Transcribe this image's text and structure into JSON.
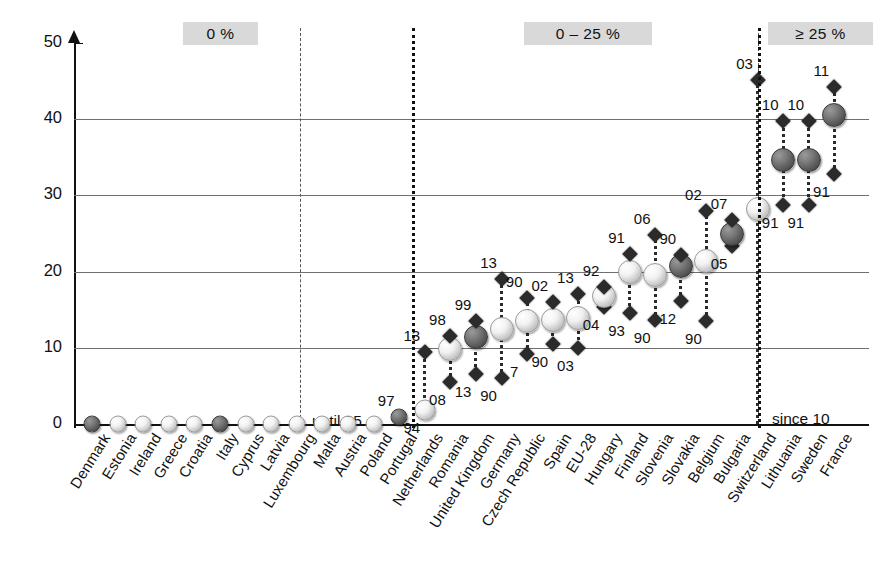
{
  "chart_data": {
    "type": "scatter",
    "title": "",
    "xlabel": "",
    "ylabel": "",
    "ylim": [
      0,
      50
    ],
    "ytick_labels": [
      "0",
      "10",
      "20",
      "30",
      "40",
      "50"
    ],
    "ytick_values": [
      0,
      10,
      20,
      30,
      40,
      50
    ],
    "grid": "horizontal gridlines at 10, 20, 30, 40",
    "legend_position": "none",
    "band_labels": [
      "0 %",
      "0 – 25 %",
      "≥ 25 %"
    ],
    "annotations": [
      "until 95",
      "since 10"
    ],
    "categories": [
      "Denmark",
      "Estonia",
      "Ireland",
      "Greece",
      "Croatia",
      "Italy",
      "Cyprus",
      "Latvia",
      "Luxembourg",
      "Malta",
      "Austria",
      "Poland",
      "Portugal",
      "Netherlands",
      "Romania",
      "United Kingdom",
      "Germany",
      "Czech Republic",
      "Spain",
      "EU-28",
      "Hungary",
      "Finland",
      "Slovenia",
      "Slovakia",
      "Belgium",
      "Bulgaria",
      "Switzerland",
      "Lithuania",
      "Sweden",
      "France"
    ],
    "points": [
      {
        "country": "Denmark",
        "top": 0,
        "bottom": 0,
        "top_year": "",
        "bottom_year": "",
        "top_marker": "sphere-dark",
        "bottom_marker": "none"
      },
      {
        "country": "Estonia",
        "top": 0,
        "bottom": 0,
        "top_year": "",
        "bottom_year": "",
        "top_marker": "sphere-light",
        "bottom_marker": "none"
      },
      {
        "country": "Ireland",
        "top": 0,
        "bottom": 0,
        "top_year": "",
        "bottom_year": "",
        "top_marker": "sphere-light",
        "bottom_marker": "none"
      },
      {
        "country": "Greece",
        "top": 0,
        "bottom": 0,
        "top_year": "",
        "bottom_year": "",
        "top_marker": "sphere-light",
        "bottom_marker": "none"
      },
      {
        "country": "Croatia",
        "top": 0,
        "bottom": 0,
        "top_year": "",
        "bottom_year": "",
        "top_marker": "sphere-light",
        "bottom_marker": "none"
      },
      {
        "country": "Italy",
        "top": 0,
        "bottom": 0,
        "top_year": "",
        "bottom_year": "",
        "top_marker": "sphere-dark",
        "bottom_marker": "none"
      },
      {
        "country": "Cyprus",
        "top": 0,
        "bottom": 0,
        "top_year": "",
        "bottom_year": "",
        "top_marker": "sphere-light",
        "bottom_marker": "none"
      },
      {
        "country": "Latvia",
        "top": 0,
        "bottom": 0,
        "top_year": "",
        "bottom_year": "",
        "top_marker": "sphere-light",
        "bottom_marker": "none"
      },
      {
        "country": "Luxembourg",
        "top": 0,
        "bottom": 0,
        "top_year": "",
        "bottom_year": "",
        "top_marker": "sphere-light",
        "bottom_marker": "none"
      },
      {
        "country": "Malta",
        "top": 0,
        "bottom": 0,
        "top_year": "",
        "bottom_year": "",
        "top_marker": "sphere-light",
        "bottom_marker": "none"
      },
      {
        "country": "Austria",
        "top": 0,
        "bottom": 0,
        "top_year": "",
        "bottom_year": "",
        "top_marker": "sphere-light",
        "bottom_marker": "none"
      },
      {
        "country": "Poland",
        "top": 0,
        "bottom": 0,
        "top_year": "",
        "bottom_year": "",
        "top_marker": "sphere-light",
        "bottom_marker": "none"
      },
      {
        "country": "Portugal",
        "top": 0.9,
        "bottom": 0.9,
        "top_year": "97",
        "bottom_year": "",
        "top_marker": "sphere-dark",
        "bottom_marker": "none"
      },
      {
        "country": "Netherlands",
        "top": 9.5,
        "bottom": 1.8,
        "top_year": "13",
        "bottom_year": "94",
        "top_marker": "diamond",
        "bottom_marker": "sphere-light"
      },
      {
        "country": "Romania",
        "top": 11.5,
        "bottom": 5.5,
        "top_year": "98",
        "bottom_year": "08",
        "top_marker": "diamond",
        "bottom_marker": "diamond",
        "mid": 9.8,
        "mid_marker": "sphere-light"
      },
      {
        "country": "United Kingdom",
        "top": 13.5,
        "bottom": 6.5,
        "top_year": "99",
        "bottom_year": "13",
        "top_marker": "diamond",
        "bottom_marker": "diamond",
        "mid": 11.4,
        "mid_marker": "sphere-dark"
      },
      {
        "country": "Germany",
        "top": 19.0,
        "bottom": 6.0,
        "top_year": "13",
        "bottom_year": "90",
        "top_marker": "diamond",
        "bottom_marker": "diamond",
        "mid": 12.5,
        "mid_marker": "sphere-light"
      },
      {
        "country": "Czech Republic",
        "top": 16.5,
        "bottom": 9.2,
        "top_year": "90",
        "bottom_year": "7",
        "top_marker": "diamond",
        "bottom_marker": "diamond",
        "mid": 13.5,
        "mid_marker": "sphere-light"
      },
      {
        "country": "Spain",
        "top": 16.0,
        "bottom": 10.5,
        "top_year": "02",
        "bottom_year": "90",
        "top_marker": "diamond",
        "bottom_marker": "diamond",
        "mid": 13.6,
        "mid_marker": "sphere-light"
      },
      {
        "country": "EU-28",
        "top": 17.0,
        "bottom": 10.0,
        "top_year": "13",
        "bottom_year": "03",
        "top_marker": "diamond",
        "bottom_marker": "diamond",
        "mid": 13.9,
        "mid_marker": "sphere-light"
      },
      {
        "country": "Hungary",
        "top": 18.0,
        "bottom": 15.4,
        "top_year": "92",
        "bottom_year": "04",
        "top_marker": "diamond",
        "bottom_marker": "diamond",
        "mid": 16.8,
        "mid_marker": "sphere-light"
      },
      {
        "country": "Finland",
        "top": 22.3,
        "bottom": 14.6,
        "top_year": "91",
        "bottom_year": "93",
        "top_marker": "diamond",
        "bottom_marker": "diamond",
        "mid": 19.9,
        "mid_marker": "sphere-light"
      },
      {
        "country": "Slovenia",
        "top": 24.8,
        "bottom": 13.7,
        "top_year": "06",
        "bottom_year": "90",
        "top_marker": "diamond",
        "bottom_marker": "diamond",
        "mid": 19.6,
        "mid_marker": "sphere-light"
      },
      {
        "country": "Slovakia",
        "top": 22.2,
        "bottom": 16.2,
        "top_year": "90",
        "bottom_year": "12",
        "top_marker": "diamond",
        "bottom_marker": "diamond",
        "mid": 20.8,
        "mid_marker": "sphere-dark"
      },
      {
        "country": "Belgium",
        "top": 28.0,
        "bottom": 13.5,
        "top_year": "02",
        "bottom_year": "90",
        "top_marker": "diamond",
        "bottom_marker": "diamond",
        "mid": 21.4,
        "mid_marker": "sphere-light"
      },
      {
        "country": "Bulgaria",
        "top": 26.8,
        "bottom": 23.3,
        "top_year": "07",
        "bottom_year": "05",
        "top_marker": "diamond",
        "bottom_marker": "diamond",
        "mid": 25.0,
        "mid_marker": "sphere-dark"
      },
      {
        "country": "Switzerland",
        "top": 45.2,
        "bottom": 0,
        "top_year": "03",
        "bottom_year": "",
        "top_marker": "diamond",
        "bottom_marker": "none",
        "mid": 28.2,
        "mid_marker": "sphere-light"
      },
      {
        "country": "Lithuania",
        "top": 39.8,
        "bottom": 28.8,
        "top_year": "10",
        "bottom_year": "91",
        "top_marker": "diamond",
        "bottom_marker": "diamond",
        "mid": 34.7,
        "mid_marker": "sphere-dark"
      },
      {
        "country": "Sweden",
        "top": 39.8,
        "bottom": 28.8,
        "top_year": "10",
        "bottom_year": "91",
        "top_marker": "diamond",
        "bottom_marker": "diamond",
        "mid": 34.7,
        "mid_marker": "sphere-dark"
      },
      {
        "country": "France",
        "top": 44.2,
        "bottom": 32.8,
        "top_year": "11",
        "bottom_year": "91",
        "top_marker": "diamond",
        "bottom_marker": "diamond",
        "mid": 40.6,
        "mid_marker": "sphere-dark"
      }
    ]
  },
  "axis": {
    "y_labels": [
      "50",
      "40",
      "30",
      "20",
      "10",
      "0"
    ]
  },
  "bands": {
    "zero": "0 %",
    "mid": "0 – 25 %",
    "high": "≥ 25 %"
  },
  "notes": {
    "until": "until 95",
    "since": "since 10"
  },
  "categories": [
    "Denmark",
    "Estonia",
    "Ireland",
    "Greece",
    "Croatia",
    "Italy",
    "Cyprus",
    "Latvia",
    "Luxembourg",
    "Malta",
    "Austria",
    "Poland",
    "Portugal",
    "Netherlands",
    "Romania",
    "United Kingdom",
    "Germany",
    "Czech Republic",
    "Spain",
    "EU-28",
    "Hungary",
    "Finland",
    "Slovenia",
    "Slovakia",
    "Belgium",
    "Bulgaria",
    "Switzerland",
    "Lithuania",
    "Sweden",
    "France"
  ]
}
